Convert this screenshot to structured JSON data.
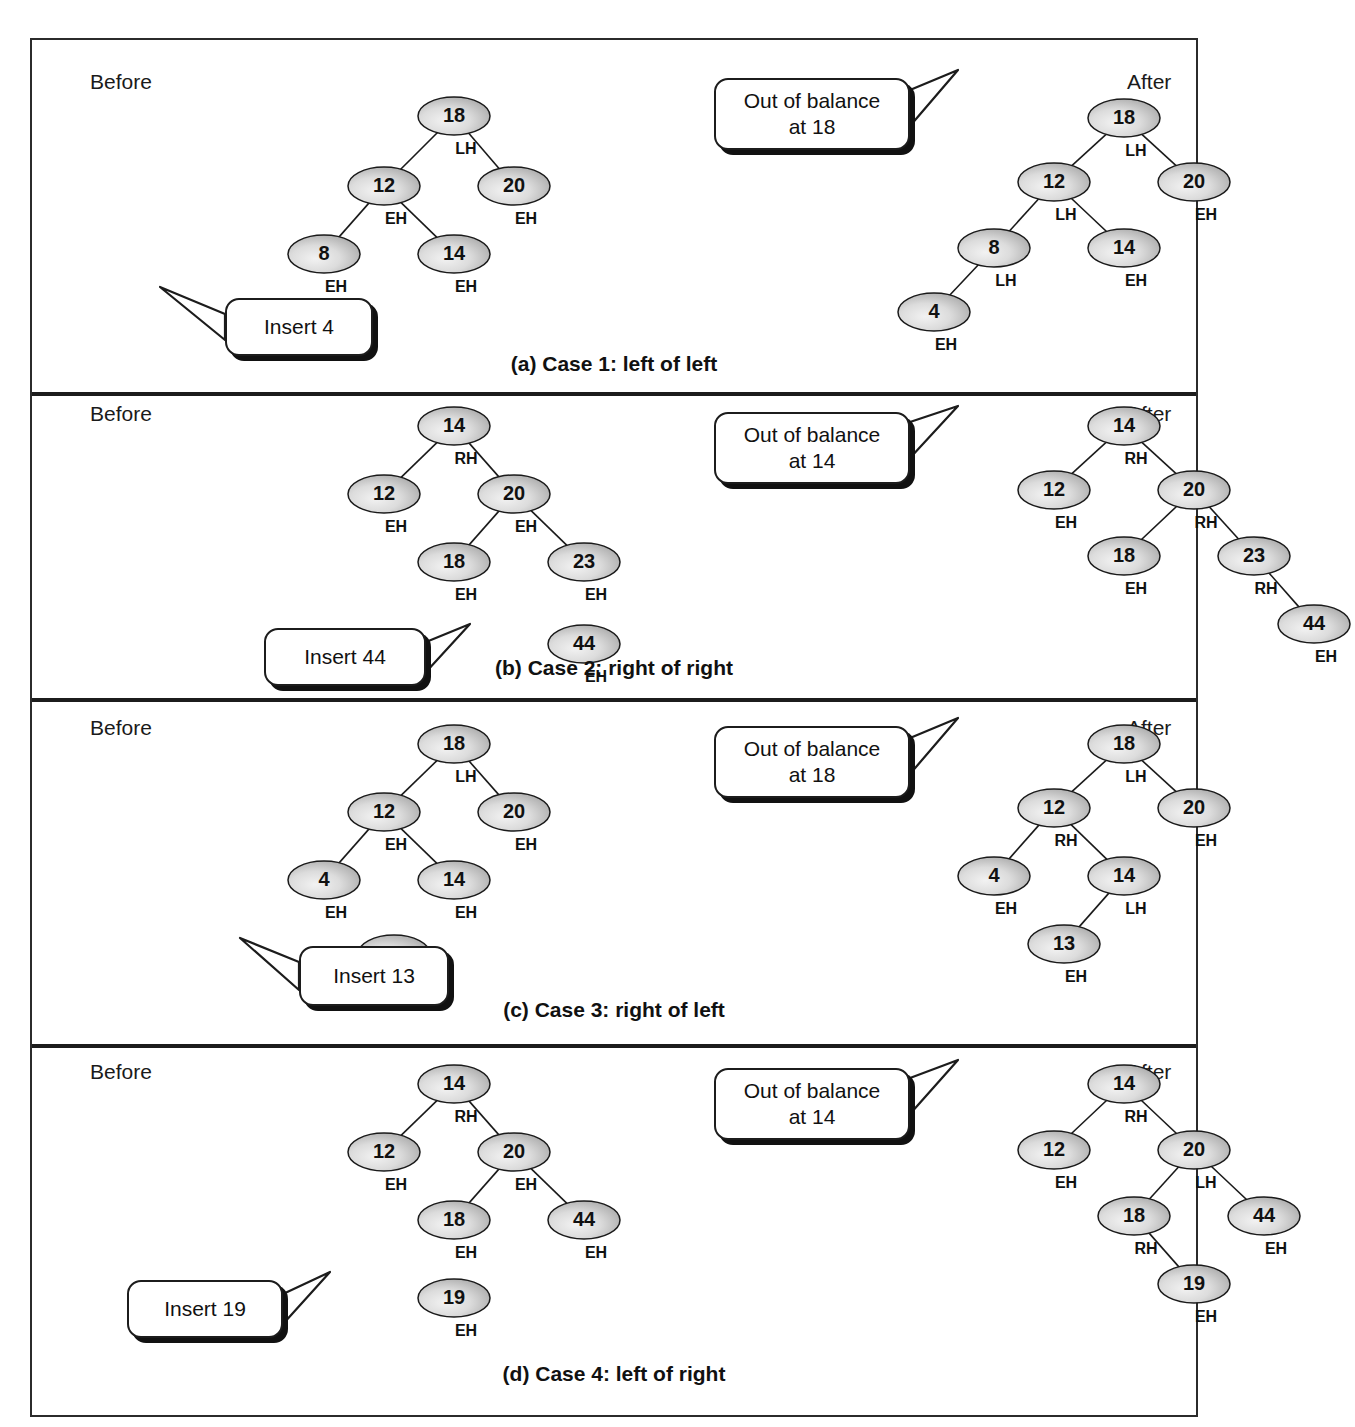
{
  "figure": {
    "side_labels": {
      "before": "Before",
      "after": "After"
    },
    "balance_codes": {
      "LH": "LH",
      "EH": "EH",
      "RH": "RH"
    }
  },
  "panels": [
    {
      "id": "case1",
      "caption": "(a) Case 1: left of left",
      "before_label": "Before",
      "after_label": "After",
      "insert_callout": "Insert 4",
      "oob_callout": "Out of balance\nat 18",
      "oob_callout_line1": "Out of balance",
      "oob_callout_line2": "at 18",
      "before_tree": {
        "nodes": [
          {
            "value": "18",
            "bf": "LH",
            "x": 252,
            "y": 46
          },
          {
            "value": "12",
            "bf": "EH",
            "x": 182,
            "y": 116
          },
          {
            "value": "20",
            "bf": "EH",
            "x": 312,
            "y": 116
          },
          {
            "value": "8",
            "bf": "EH",
            "x": 122,
            "y": 184
          },
          {
            "value": "14",
            "bf": "EH",
            "x": 252,
            "y": 184
          },
          {
            "value": "4",
            "bf": "EH",
            "x": 62,
            "y": 248
          }
        ],
        "edges": [
          [
            0,
            1
          ],
          [
            0,
            2
          ],
          [
            1,
            3
          ],
          [
            1,
            4
          ]
        ]
      },
      "after_tree": {
        "nodes": [
          {
            "value": "18",
            "bf": "LH",
            "x": 232,
            "y": 46
          },
          {
            "value": "12",
            "bf": "LH",
            "x": 162,
            "y": 110
          },
          {
            "value": "20",
            "bf": "EH",
            "x": 302,
            "y": 110
          },
          {
            "value": "8",
            "bf": "LH",
            "x": 102,
            "y": 176
          },
          {
            "value": "14",
            "bf": "EH",
            "x": 232,
            "y": 176
          },
          {
            "value": "4",
            "bf": "EH",
            "x": 42,
            "y": 240
          }
        ],
        "edges": [
          [
            0,
            1
          ],
          [
            0,
            2
          ],
          [
            1,
            3
          ],
          [
            1,
            4
          ],
          [
            3,
            5
          ]
        ]
      }
    },
    {
      "id": "case2",
      "caption": "(b) Case 2: right of right",
      "before_label": "Before",
      "after_label": "After",
      "insert_callout": "Insert 44",
      "oob_callout_line1": "Out of balance",
      "oob_callout_line2": "at 14",
      "before_tree": {
        "nodes": [
          {
            "value": "14",
            "bf": "RH",
            "x": 252,
            "y": 22
          },
          {
            "value": "12",
            "bf": "EH",
            "x": 182,
            "y": 90
          },
          {
            "value": "20",
            "bf": "EH",
            "x": 312,
            "y": 90
          },
          {
            "value": "18",
            "bf": "EH",
            "x": 252,
            "y": 158
          },
          {
            "value": "23",
            "bf": "EH",
            "x": 382,
            "y": 158
          },
          {
            "value": "44",
            "bf": "EH",
            "x": 382,
            "y": 240
          }
        ],
        "edges": [
          [
            0,
            1
          ],
          [
            0,
            2
          ],
          [
            2,
            3
          ],
          [
            2,
            4
          ]
        ]
      },
      "after_tree": {
        "nodes": [
          {
            "value": "14",
            "bf": "RH",
            "x": 232,
            "y": 22
          },
          {
            "value": "12",
            "bf": "EH",
            "x": 162,
            "y": 86
          },
          {
            "value": "20",
            "bf": "RH",
            "x": 302,
            "y": 86
          },
          {
            "value": "18",
            "bf": "EH",
            "x": 232,
            "y": 152
          },
          {
            "value": "23",
            "bf": "RH",
            "x": 362,
            "y": 152
          },
          {
            "value": "44",
            "bf": "EH",
            "x": 422,
            "y": 220
          }
        ],
        "edges": [
          [
            0,
            1
          ],
          [
            0,
            2
          ],
          [
            2,
            3
          ],
          [
            2,
            4
          ],
          [
            4,
            5
          ]
        ]
      }
    },
    {
      "id": "case3",
      "caption": "(c) Case 3: right of left",
      "before_label": "Before",
      "after_label": "After",
      "insert_callout": "Insert 13",
      "oob_callout_line1": "Out of balance",
      "oob_callout_line2": "at 18",
      "before_tree": {
        "nodes": [
          {
            "value": "18",
            "bf": "LH",
            "x": 252,
            "y": 28
          },
          {
            "value": "12",
            "bf": "EH",
            "x": 182,
            "y": 96
          },
          {
            "value": "20",
            "bf": "EH",
            "x": 312,
            "y": 96
          },
          {
            "value": "4",
            "bf": "EH",
            "x": 122,
            "y": 164
          },
          {
            "value": "14",
            "bf": "EH",
            "x": 252,
            "y": 164
          },
          {
            "value": "13",
            "bf": "EH",
            "x": 192,
            "y": 238
          }
        ],
        "edges": [
          [
            0,
            1
          ],
          [
            0,
            2
          ],
          [
            1,
            3
          ],
          [
            1,
            4
          ]
        ]
      },
      "after_tree": {
        "nodes": [
          {
            "value": "18",
            "bf": "LH",
            "x": 232,
            "y": 28
          },
          {
            "value": "12",
            "bf": "RH",
            "x": 162,
            "y": 92
          },
          {
            "value": "20",
            "bf": "EH",
            "x": 302,
            "y": 92
          },
          {
            "value": "4",
            "bf": "EH",
            "x": 102,
            "y": 160
          },
          {
            "value": "14",
            "bf": "LH",
            "x": 232,
            "y": 160
          },
          {
            "value": "13",
            "bf": "EH",
            "x": 172,
            "y": 228
          }
        ],
        "edges": [
          [
            0,
            1
          ],
          [
            0,
            2
          ],
          [
            1,
            3
          ],
          [
            1,
            4
          ],
          [
            4,
            5
          ]
        ]
      }
    },
    {
      "id": "case4",
      "caption": "(d) Case 4: left of right",
      "before_label": "Before",
      "after_label": "After",
      "insert_callout": "Insert 19",
      "oob_callout_line1": "Out of balance",
      "oob_callout_line2": "at 14",
      "before_tree": {
        "nodes": [
          {
            "value": "14",
            "bf": "RH",
            "x": 252,
            "y": 24
          },
          {
            "value": "12",
            "bf": "EH",
            "x": 182,
            "y": 92
          },
          {
            "value": "20",
            "bf": "EH",
            "x": 312,
            "y": 92
          },
          {
            "value": "18",
            "bf": "EH",
            "x": 252,
            "y": 160
          },
          {
            "value": "44",
            "bf": "EH",
            "x": 382,
            "y": 160
          },
          {
            "value": "19",
            "bf": "EH",
            "x": 252,
            "y": 238
          }
        ],
        "edges": [
          [
            0,
            1
          ],
          [
            0,
            2
          ],
          [
            2,
            3
          ],
          [
            2,
            4
          ]
        ]
      },
      "after_tree": {
        "nodes": [
          {
            "value": "14",
            "bf": "RH",
            "x": 232,
            "y": 24
          },
          {
            "value": "12",
            "bf": "EH",
            "x": 162,
            "y": 90
          },
          {
            "value": "20",
            "bf": "LH",
            "x": 302,
            "y": 90
          },
          {
            "value": "18",
            "bf": "RH",
            "x": 242,
            "y": 156
          },
          {
            "value": "44",
            "bf": "EH",
            "x": 372,
            "y": 156
          },
          {
            "value": "19",
            "bf": "EH",
            "x": 302,
            "y": 224
          }
        ],
        "edges": [
          [
            0,
            1
          ],
          [
            0,
            2
          ],
          [
            2,
            3
          ],
          [
            2,
            4
          ],
          [
            3,
            5
          ]
        ]
      }
    }
  ]
}
